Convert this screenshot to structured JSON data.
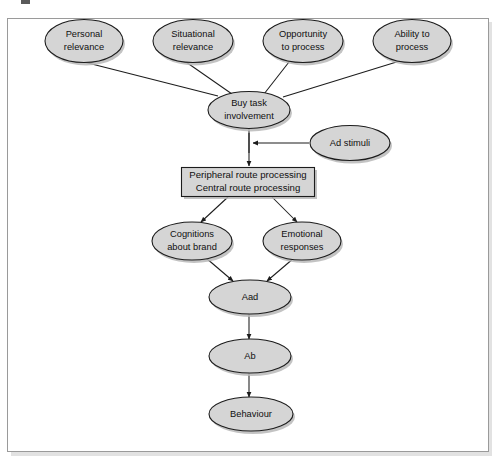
{
  "figure": {
    "frame": {
      "border_color": "#9a9a9a",
      "background_color": "#ffffff"
    },
    "style": {
      "node_fill": "#d5d5d5",
      "node_stroke": "#1c1c1c",
      "shadow_color": "#b9b9b9",
      "connector_color": "#1c1c1c",
      "text_color": "#101010"
    }
  },
  "nodes": {
    "personal_relevance": {
      "label_line1": "Personal",
      "label_line2": "relevance",
      "shape": "ellipse"
    },
    "situational_relevance": {
      "label_line1": "Situational",
      "label_line2": "relevance",
      "shape": "ellipse"
    },
    "opportunity_to_process": {
      "label_line1": "Opportunity",
      "label_line2": "to process",
      "shape": "ellipse"
    },
    "ability_to_process": {
      "label_line1": "Ability to",
      "label_line2": "process",
      "shape": "ellipse"
    },
    "buy_task_involvement": {
      "label_line1": "Buy task",
      "label_line2": "involvement",
      "shape": "ellipse"
    },
    "ad_stimuli": {
      "label_line1": "Ad stimuli",
      "shape": "ellipse"
    },
    "route_processing": {
      "label_line1": "Peripheral route processing",
      "label_line2": "Central route processing",
      "shape": "rectangle"
    },
    "cognitions_about_brand": {
      "label_line1": "Cognitions",
      "label_line2": "about brand",
      "shape": "ellipse"
    },
    "emotional_responses": {
      "label_line1": "Emotional",
      "label_line2": "responses",
      "shape": "ellipse"
    },
    "aad": {
      "label_line1": "Aad",
      "shape": "ellipse"
    },
    "ab": {
      "label_line1": "Ab",
      "shape": "ellipse"
    },
    "behaviour": {
      "label_line1": "Behaviour",
      "shape": "ellipse"
    }
  },
  "edges": [
    {
      "from": "personal_relevance",
      "to": "buy_task_involvement",
      "arrow": false
    },
    {
      "from": "situational_relevance",
      "to": "buy_task_involvement",
      "arrow": false
    },
    {
      "from": "opportunity_to_process",
      "to": "buy_task_involvement",
      "arrow": false
    },
    {
      "from": "ability_to_process",
      "to": "buy_task_involvement",
      "arrow": false
    },
    {
      "from": "buy_task_involvement",
      "to": "route_processing",
      "arrow": true
    },
    {
      "from": "ad_stimuli",
      "to": "buy_task_involvement_link",
      "arrow": true
    },
    {
      "from": "route_processing",
      "to": "cognitions_about_brand",
      "arrow": true
    },
    {
      "from": "route_processing",
      "to": "emotional_responses",
      "arrow": true
    },
    {
      "from": "cognitions_about_brand",
      "to": "aad",
      "arrow": true
    },
    {
      "from": "emotional_responses",
      "to": "aad",
      "arrow": true
    },
    {
      "from": "aad",
      "to": "ab",
      "arrow": true
    },
    {
      "from": "ab",
      "to": "behaviour",
      "arrow": true
    }
  ]
}
